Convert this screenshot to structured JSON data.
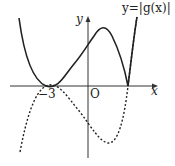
{
  "diagram": {
    "function_label": "y=|g(x)|",
    "y_axis_label": "y",
    "x_axis_label": "x",
    "origin_label": "O",
    "x_tick_label": "−3",
    "curves": [
      {
        "name": "y=|g(x)|",
        "style": "solid",
        "color": "#222222"
      },
      {
        "name": "y=g(x)",
        "style": "dotted",
        "color": "#222222"
      }
    ]
  }
}
